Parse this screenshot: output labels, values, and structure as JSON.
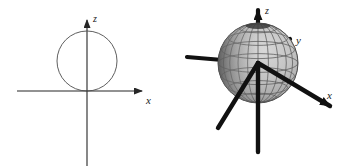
{
  "figure": {
    "title": "",
    "background_color": "#ffffff",
    "width": 345,
    "height": 167,
    "panel_count": 2
  },
  "panels": [
    {
      "id": "panel-2d",
      "name": "two-dimensional-cross-section",
      "description": "2D xz cross-section: circle tangent to the x-axis at the origin",
      "axes": [
        {
          "name": "x-axis",
          "label": "x",
          "direction": "horizontal-right",
          "arrow": true
        },
        {
          "name": "z-axis",
          "label": "z",
          "direction": "vertical-up",
          "arrow": true
        }
      ],
      "shapes": [
        {
          "name": "circle",
          "type": "circle",
          "center_x": 0,
          "center_z": 1,
          "radius": 1,
          "stroke_color": "#4d4d4d",
          "fill": "none",
          "tangent_to": "x-axis"
        }
      ],
      "axis_color": "#262626"
    },
    {
      "id": "panel-3d",
      "name": "three-dimensional-sphere",
      "description": "3D perspective: shaded wireframe sphere centered on the origin with x, y, z axes",
      "axes": [
        {
          "name": "x-axis",
          "label": "x",
          "direction": "front-right-down",
          "arrow": true
        },
        {
          "name": "y-axis",
          "label": "y",
          "direction": "back-right-up",
          "arrow": true
        },
        {
          "name": "z-axis",
          "label": "z",
          "direction": "vertical-up",
          "arrow": true
        },
        {
          "name": "negative-x-axis",
          "label": "",
          "direction": "back-left-up",
          "arrow": false
        },
        {
          "name": "negative-y-axis",
          "label": "",
          "direction": "front-left-down",
          "arrow": false
        },
        {
          "name": "negative-z-axis",
          "label": "",
          "direction": "vertical-down",
          "arrow": false
        }
      ],
      "shapes": [
        {
          "name": "sphere",
          "type": "sphere-wireframe",
          "center_x": 0,
          "center_y": 0,
          "center_z": 0,
          "radius": 1,
          "fill_color": "#c0c0c0",
          "grid_color": "#595959",
          "shadow_color": "#6e6e6e",
          "meridians": 12,
          "parallels": 7
        }
      ],
      "axis_color": "#111111"
    }
  ],
  "colors": {
    "background": "#ffffff",
    "thin_axis": "#262626",
    "thick_axis": "#111111",
    "circle_stroke": "#4d4d4d",
    "sphere_light": "#c9c9c9",
    "sphere_mid": "#b0b0b0",
    "sphere_dark": "#6e6e6e",
    "sphere_grid": "#595959",
    "label_text": "#1a1a1a"
  },
  "labels": {
    "left_x": "x",
    "left_z": "z",
    "right_x": "x",
    "right_y": "y",
    "right_z": "z"
  }
}
